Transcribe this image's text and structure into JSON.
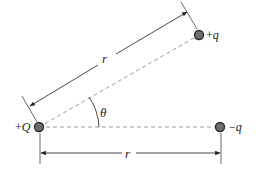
{
  "diagram": {
    "charges": [
      {
        "id": "source",
        "sign": "+",
        "symbol": "Q",
        "label": "+Q",
        "x": 39,
        "y": 127
      },
      {
        "id": "test-positive",
        "sign": "+",
        "symbol": "q",
        "label": "+q",
        "x": 199,
        "y": 35
      },
      {
        "id": "test-negative",
        "sign": "−",
        "symbol": "q",
        "label": "−q",
        "x": 220,
        "y": 127
      }
    ],
    "distances": [
      {
        "id": "slanted",
        "label": "r"
      },
      {
        "id": "horizontal",
        "label": "r"
      }
    ],
    "angle": {
      "label": "θ"
    },
    "colors": {
      "charge_fill": "#6e6e6e",
      "charge_stroke": "#2a2a2a",
      "line": "#444444",
      "dashed": "#9a9a9a"
    }
  }
}
